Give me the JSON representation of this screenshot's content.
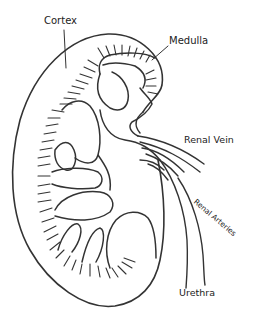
{
  "diagram": {
    "line_color": "#333333",
    "background": "#ffffff",
    "labels": {
      "cortex": "Cortex",
      "medulla": "Medulla",
      "renal_vein": "Renal Vein",
      "renal_arteries": "Renal Arteries",
      "ureter": "Urethra"
    }
  }
}
